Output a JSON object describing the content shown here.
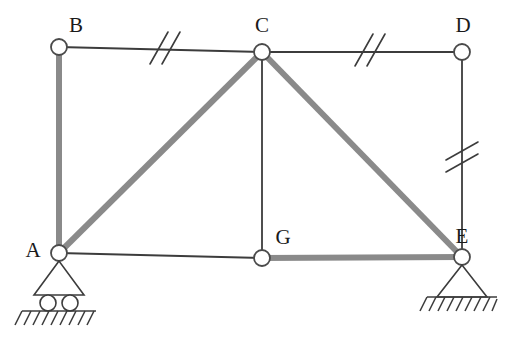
{
  "diagram": {
    "type": "truss",
    "colors": {
      "thick_member": "#8a8a8a",
      "thin_member": "#3c3c3c",
      "node_stroke": "#4a4a4a",
      "node_fill": "#ffffff",
      "label_color": "#1a1a1a",
      "background": "#ffffff",
      "tick_color": "#3c3c3c",
      "hatch_color": "#3c3c3c"
    },
    "nodes": [
      {
        "id": "A",
        "label": "A",
        "x": 59,
        "y": 253,
        "label_x": 33,
        "label_y": 252,
        "radius": 8
      },
      {
        "id": "B",
        "label": "B",
        "x": 59,
        "y": 47,
        "label_x": 76,
        "label_y": 27,
        "radius": 8
      },
      {
        "id": "C",
        "label": "C",
        "x": 262,
        "y": 52,
        "label_x": 262,
        "label_y": 27,
        "radius": 8
      },
      {
        "id": "D",
        "label": "D",
        "x": 462,
        "y": 52,
        "label_x": 463,
        "label_y": 27,
        "radius": 8
      },
      {
        "id": "E",
        "label": "E",
        "x": 462,
        "y": 257,
        "label_x": 462,
        "label_y": 238,
        "radius": 8
      },
      {
        "id": "G",
        "label": "G",
        "x": 262,
        "y": 258,
        "label_x": 283,
        "label_y": 239,
        "radius": 8
      }
    ],
    "members": [
      {
        "id": "AB",
        "from": "A",
        "to": "B",
        "weight": "thick",
        "ticks": 0
      },
      {
        "id": "BC",
        "from": "B",
        "to": "C",
        "weight": "thin",
        "ticks": 2
      },
      {
        "id": "CD",
        "from": "C",
        "to": "D",
        "weight": "thin",
        "ticks": 2
      },
      {
        "id": "DE",
        "from": "D",
        "to": "E",
        "weight": "thin",
        "ticks": 2
      },
      {
        "id": "AC",
        "from": "A",
        "to": "C",
        "weight": "thick",
        "ticks": 0
      },
      {
        "id": "CE",
        "from": "C",
        "to": "E",
        "weight": "thick",
        "ticks": 0
      },
      {
        "id": "CG",
        "from": "C",
        "to": "G",
        "weight": "thin",
        "ticks": 0
      },
      {
        "id": "AG",
        "from": "A",
        "to": "G",
        "weight": "thin",
        "ticks": 0
      },
      {
        "id": "GE",
        "from": "G",
        "to": "E",
        "weight": "thick",
        "ticks": 0
      }
    ],
    "supports": [
      {
        "id": "support-A",
        "node": "A",
        "kind": "roller",
        "roller_count": 2
      },
      {
        "id": "support-E",
        "node": "E",
        "kind": "pinned",
        "roller_count": 0
      }
    ],
    "tick_marks": [
      {
        "member": "BC",
        "x": 160,
        "y": 48,
        "angle": 60,
        "count": 2
      },
      {
        "member": "CD",
        "x": 365,
        "y": 50,
        "angle": 60,
        "count": 2
      },
      {
        "member": "DE",
        "x": 462,
        "y": 152,
        "angle": 60,
        "count": 2
      }
    ]
  }
}
